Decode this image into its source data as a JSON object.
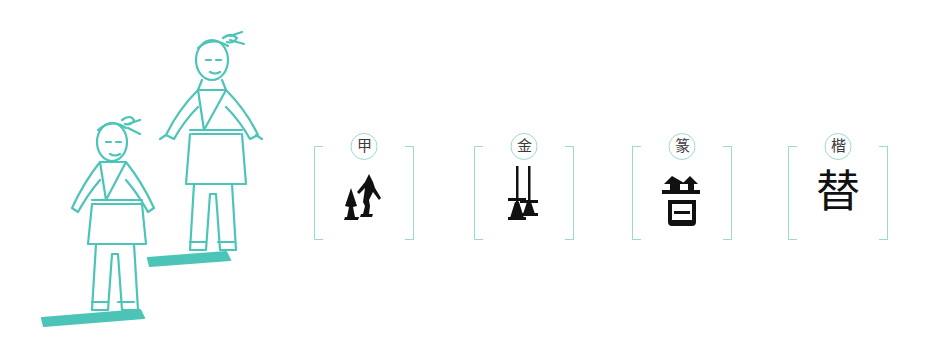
{
  "illustration": {
    "description": "Two boys in traditional robes walking one behind the other",
    "color": "#4cc4b7"
  },
  "panels": [
    {
      "script_label": "甲",
      "script_name": "oracle bone script",
      "character": "替",
      "glyph_style": "two-walking-figures"
    },
    {
      "script_label": "金",
      "script_name": "bronze script",
      "character": "替",
      "glyph_style": "two-standing-figures"
    },
    {
      "script_label": "篆",
      "script_name": "seal script",
      "character": "替",
      "glyph_style": "seal-form"
    },
    {
      "script_label": "楷",
      "script_name": "regular script",
      "character": "替",
      "glyph_style": "regular"
    }
  ],
  "colors": {
    "accent": "#4cc4b7",
    "frame": "#9ed8d2",
    "ink": "#111111"
  }
}
